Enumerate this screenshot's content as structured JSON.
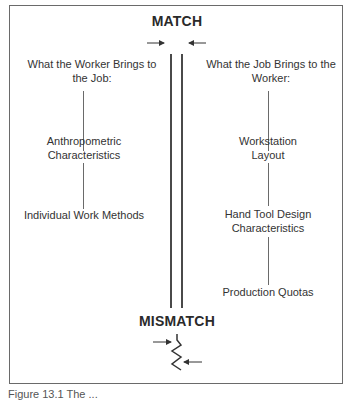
{
  "diagram": {
    "top_label": "MATCH",
    "bottom_label": "MISMATCH",
    "left_column": {
      "heading": "What the Worker Brings to the Job:",
      "heading_lines": [
        "What the Worker Brings to",
        "the Job:"
      ],
      "items": [
        {
          "lines": [
            "Anthropometric",
            "Characteristics"
          ]
        },
        {
          "lines": [
            "Individual Work Methods"
          ]
        }
      ]
    },
    "right_column": {
      "heading": "What the Job Brings to the Worker:",
      "heading_lines": [
        "What the Job Brings to the",
        "Worker:"
      ],
      "items": [
        {
          "lines": [
            "Workstation",
            "Layout"
          ]
        },
        {
          "lines": [
            "Hand Tool Design",
            "Characteristics"
          ]
        },
        {
          "lines": [
            "Production Quotas"
          ]
        }
      ]
    },
    "caption": "Figure 13.1  The ..."
  }
}
